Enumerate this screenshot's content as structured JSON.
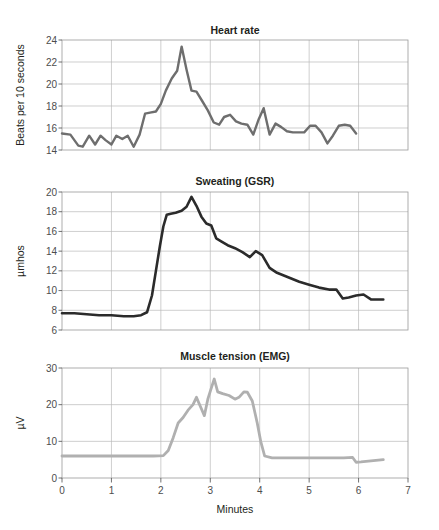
{
  "figure": {
    "x_axis_title": "Minutes",
    "x_ticks": [
      "0",
      "1",
      "2",
      "3",
      "4",
      "5",
      "6",
      "7"
    ]
  },
  "panels": {
    "heart_rate": {
      "title": "Heart rate",
      "y_title": "Beats per 10 seconds",
      "y_ticks": [
        "14",
        "16",
        "18",
        "20",
        "22",
        "24"
      ],
      "line_color": "#6e6e6e"
    },
    "gsr": {
      "title": "Sweating (GSR)",
      "y_title": "µmhos",
      "y_ticks": [
        "6",
        "8",
        "10",
        "12",
        "14",
        "16",
        "18",
        "20"
      ],
      "line_color": "#2b2b2b"
    },
    "emg": {
      "title": "Muscle tension (EMG)",
      "y_title": "µV",
      "y_ticks": [
        "0",
        "10",
        "20",
        "30"
      ],
      "line_color": "#b0b0b0"
    }
  },
  "chart_data": [
    {
      "type": "line",
      "title": "Heart rate",
      "xlabel": "Minutes",
      "ylabel": "Beats per 10 seconds",
      "xlim": [
        0,
        7
      ],
      "ylim": [
        14,
        24
      ],
      "grid": true,
      "legend": "none",
      "series": [
        {
          "name": "Heart rate",
          "color": "#6e6e6e",
          "x": [
            0.0,
            0.17,
            0.33,
            0.42,
            0.55,
            0.67,
            0.78,
            0.88,
            1.0,
            1.1,
            1.22,
            1.33,
            1.45,
            1.57,
            1.68,
            1.78,
            1.9,
            2.0,
            2.1,
            2.22,
            2.33,
            2.42,
            2.52,
            2.62,
            2.72,
            2.83,
            2.95,
            3.07,
            3.18,
            3.28,
            3.4,
            3.52,
            3.63,
            3.75,
            3.87,
            3.98,
            4.08,
            4.2,
            4.32,
            4.43,
            4.55,
            4.67,
            4.78,
            4.9,
            5.02,
            5.13,
            5.25,
            5.37,
            5.48,
            5.6,
            5.72,
            5.83,
            5.95,
            6.07,
            6.18,
            6.3,
            6.42,
            6.5
          ],
          "y": [
            15.5,
            15.4,
            14.4,
            14.3,
            15.3,
            14.5,
            15.3,
            14.9,
            14.5,
            15.3,
            15.0,
            15.3,
            14.3,
            15.4,
            17.3,
            17.4,
            17.5,
            18.2,
            19.4,
            20.5,
            21.2,
            23.4,
            21.3,
            19.4,
            19.3,
            18.5,
            17.6,
            16.5,
            16.3,
            17.0,
            17.2,
            16.6,
            16.4,
            16.3,
            15.4,
            16.8,
            17.8,
            15.4,
            16.4,
            16.1,
            15.7,
            15.6,
            15.6,
            15.6,
            16.2,
            16.2,
            15.6,
            14.6,
            15.3,
            16.2,
            16.3,
            16.2,
            15.5
          ]
        }
      ]
    },
    {
      "type": "line",
      "title": "Sweating (GSR)",
      "xlabel": "Minutes",
      "ylabel": "µmhos",
      "xlim": [
        0,
        7
      ],
      "ylim": [
        6,
        20
      ],
      "grid": true,
      "legend": "none",
      "series": [
        {
          "name": "Sweating (GSR)",
          "color": "#2b2b2b",
          "x": [
            0.0,
            0.25,
            0.5,
            0.75,
            1.0,
            1.25,
            1.45,
            1.6,
            1.72,
            1.82,
            1.9,
            1.98,
            2.05,
            2.12,
            2.2,
            2.3,
            2.42,
            2.52,
            2.62,
            2.72,
            2.82,
            2.92,
            3.02,
            3.12,
            3.22,
            3.35,
            3.5,
            3.65,
            3.8,
            3.92,
            4.05,
            4.2,
            4.35,
            4.5,
            4.65,
            4.8,
            5.0,
            5.2,
            5.4,
            5.55,
            5.68,
            5.8,
            5.95,
            6.1,
            6.25,
            6.4,
            6.5
          ],
          "y": [
            7.7,
            7.7,
            7.6,
            7.5,
            7.5,
            7.4,
            7.4,
            7.5,
            7.8,
            9.5,
            12.0,
            14.5,
            16.5,
            17.7,
            17.8,
            17.9,
            18.1,
            18.5,
            19.5,
            18.6,
            17.5,
            16.8,
            16.6,
            15.3,
            15.0,
            14.6,
            14.3,
            13.9,
            13.4,
            14.0,
            13.6,
            12.3,
            11.8,
            11.5,
            11.2,
            10.9,
            10.6,
            10.3,
            10.1,
            10.1,
            9.2,
            9.3,
            9.5,
            9.6,
            9.1,
            9.1,
            9.1
          ]
        }
      ]
    },
    {
      "type": "line",
      "title": "Muscle tension (EMG)",
      "xlabel": "Minutes",
      "ylabel": "µV",
      "xlim": [
        0,
        7
      ],
      "ylim": [
        0,
        30
      ],
      "grid": true,
      "legend": "none",
      "series": [
        {
          "name": "Muscle tension (EMG)",
          "color": "#b0b0b0",
          "x": [
            0.0,
            0.5,
            1.0,
            1.5,
            1.85,
            2.05,
            2.15,
            2.25,
            2.35,
            2.45,
            2.55,
            2.65,
            2.72,
            2.8,
            2.88,
            2.95,
            3.02,
            3.08,
            3.15,
            3.25,
            3.38,
            3.5,
            3.58,
            3.68,
            3.75,
            3.85,
            3.95,
            4.02,
            4.1,
            4.25,
            4.5,
            4.8,
            5.1,
            5.4,
            5.7,
            5.88,
            5.95,
            6.05,
            6.2,
            6.35,
            6.5
          ],
          "y": [
            6.0,
            6.0,
            6.0,
            6.0,
            6.0,
            6.1,
            7.5,
            11.0,
            15.0,
            16.5,
            18.5,
            20.0,
            22.0,
            19.5,
            17.0,
            21.5,
            24.5,
            27.0,
            23.5,
            23.0,
            22.5,
            21.5,
            22.0,
            23.5,
            23.4,
            21.0,
            15.0,
            10.0,
            6.0,
            5.5,
            5.5,
            5.5,
            5.5,
            5.5,
            5.5,
            5.6,
            4.3,
            4.4,
            4.6,
            4.8,
            5.0
          ]
        }
      ]
    }
  ]
}
